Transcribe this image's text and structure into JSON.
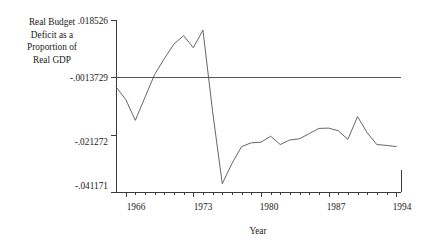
{
  "chart_data": {
    "type": "line",
    "title": "",
    "xlabel": "Year",
    "ylabel": "Real Budget Deficit as a Proportion of Real GDP",
    "ylabel_lines": [
      "Real Budget",
      "Deficit as a",
      "Proportion of",
      "Real GDP"
    ],
    "grid": false,
    "legend": "none",
    "xlim": [
      1965,
      1994.5
    ],
    "ylim": [
      -0.041171,
      0.018526
    ],
    "xticks": [
      1966,
      1973,
      1980,
      1987,
      1994
    ],
    "xtick_labels": [
      "1966",
      "1973",
      "1980",
      "1987",
      "1994"
    ],
    "xticks_minor_step": 1,
    "yticks": [
      0.018526,
      -0.0013729,
      -0.021272,
      -0.041171
    ],
    "ytick_labels": [
      ".018526",
      "-.0013729",
      "-.021272",
      "-.041171"
    ],
    "reference_line": {
      "orientation": "horizontal",
      "value": -0.0013729,
      "label": "-.0013729"
    },
    "series": [
      {
        "name": "Real Budget Deficit as a Proportion of Real GDP",
        "color": "#555555",
        "x": [
          1965,
          1966,
          1967,
          1968,
          1969,
          1970,
          1971,
          1972,
          1973,
          1974,
          1975,
          1976,
          1977,
          1978,
          1979,
          1980,
          1981,
          1982,
          1983,
          1984,
          1985,
          1986,
          1987,
          1988,
          1989,
          1990,
          1991,
          1992,
          1993,
          1994
        ],
        "y": [
          -0.0047,
          -0.009,
          -0.0163,
          -0.0083,
          -0.0004,
          0.0051,
          0.0102,
          0.0131,
          0.0089,
          0.015,
          -0.0133,
          -0.0383,
          -0.0313,
          -0.0254,
          -0.0241,
          -0.0239,
          -0.0218,
          -0.0247,
          -0.0231,
          -0.0227,
          -0.0209,
          -0.0191,
          -0.019,
          -0.0199,
          -0.0229,
          -0.015,
          -0.0206,
          -0.0247,
          -0.025,
          -0.0254
        ]
      }
    ]
  },
  "axis": {
    "ytick_0": ".018526",
    "ytick_1": "-.0013729",
    "ytick_2": "-.021272",
    "ytick_3": "-.041171",
    "xtick_0": "1966",
    "xtick_1": "1973",
    "xtick_2": "1980",
    "xtick_3": "1987",
    "xtick_4": "1994",
    "xtitle": "Year"
  },
  "ylabel_lines": {
    "l0": "Real Budget",
    "l1": "Deficit as a",
    "l2": "Proportion of",
    "l3": "Real GDP"
  },
  "colors": {
    "line": "#555555",
    "axis": "#3a3a3a",
    "text": "#1a1a1a",
    "background": "#ffffff"
  }
}
